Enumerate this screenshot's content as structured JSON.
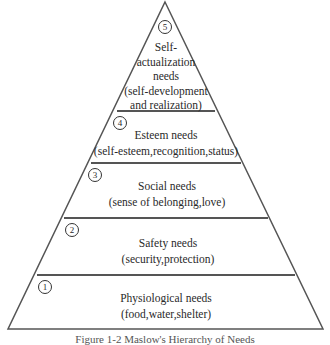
{
  "figure": {
    "caption": "Figure 1-2  Maslow's Hierarchy of Needs",
    "line_color": "#555555",
    "levels": [
      {
        "number": "5",
        "title": "Self-",
        "lines": [
          "Self-",
          "actualization",
          "needs",
          "(self-development",
          "and realization)"
        ]
      },
      {
        "number": "4",
        "title": "Esteem needs",
        "detail": "(self-esteem,recognition,status)"
      },
      {
        "number": "3",
        "title": "Social needs",
        "detail": "(sense of belonging,love)"
      },
      {
        "number": "2",
        "title": "Safety needs",
        "detail": "(security,protection)"
      },
      {
        "number": "1",
        "title": "Physiological needs",
        "detail": "(food,water,shelter)"
      }
    ]
  }
}
